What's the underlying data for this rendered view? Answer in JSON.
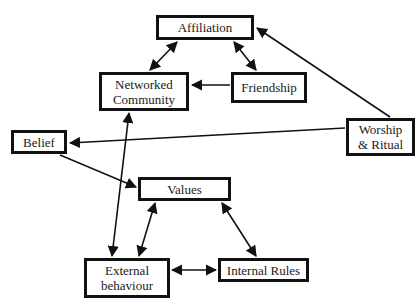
{
  "diagram": {
    "nodes": {
      "affiliation": {
        "label": "Affiliation",
        "box": [
          156,
          15,
          98,
          25
        ]
      },
      "networked_community": {
        "label": "Networked\nCommunity",
        "box": [
          99,
          72,
          90,
          39
        ]
      },
      "friendship": {
        "label": "Friendship",
        "box": [
          231,
          72,
          76,
          31
        ]
      },
      "worship_ritual": {
        "label": "Worship\n& Ritual",
        "box": [
          346,
          118,
          69,
          38
        ]
      },
      "belief": {
        "label": "Belief",
        "box": [
          11,
          130,
          56,
          24
        ]
      },
      "values": {
        "label": "Values",
        "box": [
          138,
          177,
          93,
          24
        ]
      },
      "external_behaviour": {
        "label": "External\nbehaviour",
        "box": [
          84,
          258,
          86,
          40
        ]
      },
      "internal_rules": {
        "label": "Internal Rules",
        "box": [
          218,
          258,
          91,
          24
        ]
      }
    },
    "edges": [
      {
        "from": "networked_community",
        "to": "affiliation",
        "type": "bidirectional"
      },
      {
        "from": "friendship",
        "to": "affiliation",
        "type": "bidirectional"
      },
      {
        "from": "friendship",
        "to": "networked_community",
        "type": "directed"
      },
      {
        "from": "worship_ritual",
        "to": "affiliation",
        "type": "directed"
      },
      {
        "from": "worship_ritual",
        "to": "belief",
        "type": "directed"
      },
      {
        "from": "belief",
        "to": "values",
        "type": "directed"
      },
      {
        "from": "networked_community",
        "to": "external_behaviour",
        "type": "bidirectional"
      },
      {
        "from": "values",
        "to": "external_behaviour",
        "type": "bidirectional"
      },
      {
        "from": "values",
        "to": "internal_rules",
        "type": "bidirectional"
      },
      {
        "from": "external_behaviour",
        "to": "internal_rules",
        "type": "bidirectional"
      }
    ],
    "colors": {
      "stroke": "#111111",
      "fill": "#ffffff",
      "text": "#1a1a1a"
    }
  }
}
